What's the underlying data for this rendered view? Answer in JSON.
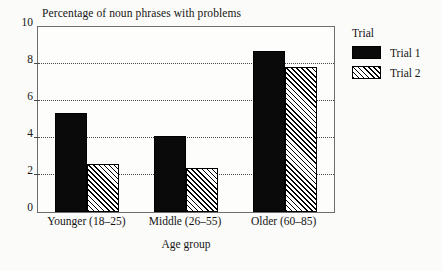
{
  "chart_data": {
    "type": "bar",
    "title": "Percentage of noun phrases with problems",
    "xlabel": "Age group",
    "ylabel": "",
    "categories": [
      "Younger (18–25)",
      "Middle (26–55)",
      "Older (60–85)"
    ],
    "series": [
      {
        "name": "Trial 1",
        "values": [
          5.35,
          4.1,
          8.7
        ],
        "fill": "solid-black"
      },
      {
        "name": "Trial 2",
        "values": [
          2.6,
          2.4,
          7.85
        ],
        "fill": "diagonal-hatch"
      }
    ],
    "ylim": [
      0,
      10
    ],
    "yticks": [
      0,
      2,
      4,
      6,
      8,
      10
    ],
    "ytick_labels": [
      "0",
      "2",
      "4",
      "6",
      "8",
      "10"
    ],
    "grid": "horizontal-dotted",
    "legend_title": "Trial",
    "legend_position": "right",
    "colors": {
      "series_1": "#0a0a0a",
      "series_2_hatch": "#000000",
      "axis": "#6d6d6d",
      "grid": "#4a4a4a",
      "background": "#fbfbf9"
    }
  }
}
